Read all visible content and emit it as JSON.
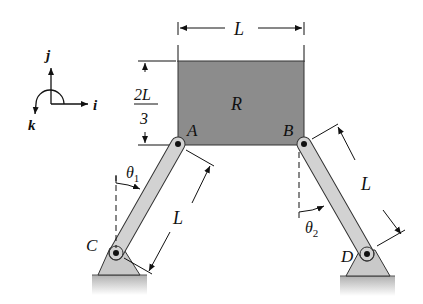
{
  "diagram": {
    "axes": {
      "j_label": "j",
      "i_label": "i",
      "k_label": "k"
    },
    "plate": {
      "label": "R",
      "fill": "#8c8c8c"
    },
    "points": {
      "A": "A",
      "B": "B",
      "C": "C",
      "D": "D"
    },
    "dimensions": {
      "width": "L",
      "height_num": "2L",
      "height_den": "3",
      "link_CA": "L",
      "link_BD": "L"
    },
    "angles": {
      "theta1": "θ",
      "theta1_sub": "1",
      "theta2": "θ",
      "theta2_sub": "2"
    },
    "colors": {
      "link_fill": "#d2d2d2",
      "support_fill": "#c9c9c9",
      "ground": "#b5b5b5",
      "line": "#111111"
    }
  }
}
